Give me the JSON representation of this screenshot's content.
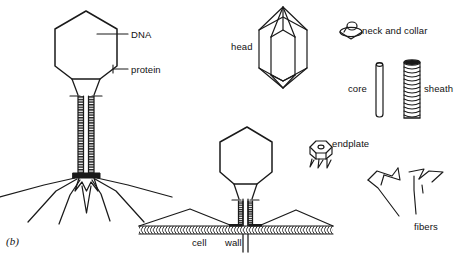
{
  "figure": {
    "panel_id": "(b)",
    "stroke_color": "#1a1a1a",
    "background_color": "#ffffff"
  },
  "labels": {
    "dna": "DNA",
    "protein": "protein",
    "head": "head",
    "neck_and_collar": "neck and collar",
    "core": "core",
    "sheath": "sheath",
    "endplate": "endplate",
    "fibers": "fibers",
    "cell": "cell",
    "wall": "wall"
  },
  "diagram_parts": [
    {
      "name": "intact-phage",
      "description": "Whole bacteriophage drawn in side view with hexagonal head, long striated tail sheath, baseplate and six splayed tail fibers",
      "labels": [
        "DNA",
        "protein"
      ]
    },
    {
      "name": "attached-phage",
      "description": "Bacteriophage attached to a bacterial cell wall with contracted sheath and core penetrating the wall",
      "labels": [
        "cell",
        "wall"
      ]
    },
    {
      "name": "head-component",
      "description": "Isolated hexagonal prism head with pyramidal caps shown in three-quarter view",
      "labels": [
        "head"
      ]
    },
    {
      "name": "neck-and-collar-component",
      "description": "Small disc-shaped collar with a looped neck on top",
      "labels": [
        "neck and collar"
      ]
    },
    {
      "name": "core-component",
      "description": "Thin hollow vertical tube with rounded top",
      "labels": [
        "core"
      ]
    },
    {
      "name": "sheath-component",
      "description": "Thick contractile tube with helical striations",
      "labels": [
        "sheath"
      ]
    },
    {
      "name": "endplate-component",
      "description": "Hexagonal baseplate with a central hole and short pins beneath",
      "labels": [
        "endplate"
      ]
    },
    {
      "name": "fibers-component",
      "description": "Two groups of bent zigzag tail fibers",
      "labels": [
        "fibers"
      ]
    }
  ]
}
